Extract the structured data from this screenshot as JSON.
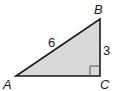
{
  "figure": {
    "type": "right-triangle",
    "fill_color": "#d9d9d9",
    "stroke_color": "#1a1a1a",
    "vertices": [
      {
        "name": "A",
        "label": "A"
      },
      {
        "name": "B",
        "label": "B"
      },
      {
        "name": "C",
        "label": "C"
      }
    ],
    "sides": [
      {
        "between": "AB",
        "label": "6"
      },
      {
        "between": "BC",
        "label": "3"
      }
    ],
    "right_angle_at": "C"
  }
}
